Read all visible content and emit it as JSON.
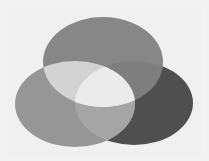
{
  "diagram": {
    "type": "venn-3",
    "sets": [
      {
        "id": "top",
        "cx": 103,
        "cy": 62,
        "rx": 60,
        "ry": 45,
        "color": "#878787"
      },
      {
        "id": "left",
        "cx": 75,
        "cy": 104,
        "rx": 60,
        "ry": 43,
        "color": "#969696"
      },
      {
        "id": "right",
        "cx": 134,
        "cy": 103,
        "rx": 59,
        "ry": 42,
        "color": "#4f4f4f"
      }
    ],
    "intersections": {
      "top_left": "#d3d3d3",
      "top_right": "#7e7e7e",
      "left_right": "#a5a5a5",
      "all": "#ebebeb"
    },
    "background": "#f2f2f2"
  }
}
